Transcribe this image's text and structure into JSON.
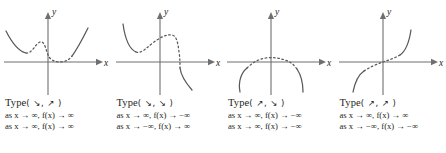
{
  "figure": {
    "colors": {
      "axis": "#6f6f70",
      "curve": "#58585b",
      "text": "#231f20",
      "background": "#ffffff"
    },
    "axis_labels": {
      "x": "x",
      "y": "y"
    }
  },
  "panels": [
    {
      "id": "panel-1",
      "type_label": "Type",
      "type_arrows": "( ↘, ↗ )",
      "arrow_left": "down-right-arrow",
      "arrow_right": "up-right-arrow",
      "limit_right": "as x → ∞, f(x) → ∞",
      "limit_left": "as x → ∞, f(x) → ∞",
      "x_label": "x",
      "y_label": "y",
      "curve_description": "W-shaped quartic: falls from upper left, local min, local max hump, local min near origin, rises to upper right"
    },
    {
      "id": "panel-2",
      "type_label": "Type",
      "type_arrows": "( ↘, ↘ )",
      "arrow_left": "down-right-arrow",
      "arrow_right": "down-right-arrow",
      "limit_right": "as x → ∞, f(x) → −∞",
      "limit_left": "as x → −∞, f(x) → ∞",
      "x_label": "x",
      "y_label": "y",
      "curve_description": "Falls from upper left to local min, rises to local max hump above axis, then falls steeply to lower right"
    },
    {
      "id": "panel-3",
      "type_label": "Type",
      "type_arrows": "( ↗, ↘ )",
      "arrow_left": "up-right-arrow",
      "arrow_right": "down-right-arrow",
      "limit_right": "as x → ∞, f(x) → −∞",
      "limit_left": "as x → ∞, f(x) → −∞",
      "x_label": "x",
      "y_label": "y",
      "curve_description": "Arch shape: rises from lower left, flat hump just below the x-axis near the origin, falls to lower right"
    },
    {
      "id": "panel-4",
      "type_label": "Type",
      "type_arrows": "( ↗, ↗ )",
      "arrow_left": "up-right-arrow",
      "arrow_right": "up-right-arrow",
      "limit_right": "as x → ∞, f(x) → ∞",
      "limit_left": "as x → −∞, f(x) → −∞",
      "x_label": "x",
      "y_label": "y",
      "curve_description": "S-shaped cubic rising from lower left through the origin to upper right"
    }
  ]
}
